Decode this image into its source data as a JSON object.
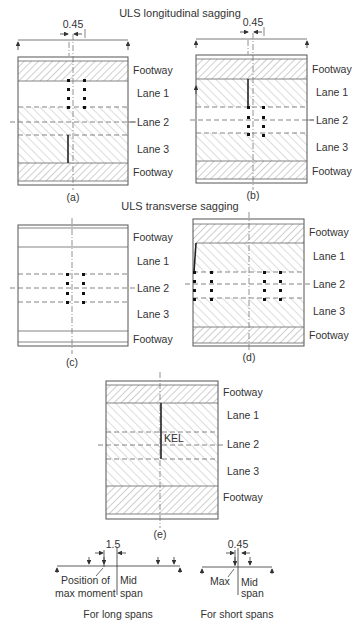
{
  "titles": {
    "longitudinal": "ULS longitudinal sagging",
    "transverse": "ULS transverse sagging"
  },
  "dimension_labels": {
    "a": "0.45",
    "b": "0.45"
  },
  "lanes": [
    "Footway",
    "Lane 1",
    "Lane 2",
    "Lane 3",
    "Footway"
  ],
  "panels": {
    "a": {
      "caption": "(a)"
    },
    "b": {
      "caption": "(b)"
    },
    "c": {
      "caption": "(c)"
    },
    "d": {
      "caption": "(d)"
    },
    "e": {
      "caption": "(e)",
      "kel_label": "KEL"
    }
  },
  "long_spans": {
    "dimension": "1.5",
    "label_position": "Position of",
    "label_max_moment": "max moment",
    "label_mid": "Mid",
    "label_span": "span",
    "caption": "For long spans"
  },
  "short_spans": {
    "dimension": "0.45",
    "label_max": "Max",
    "label_mid": "Mid",
    "label_span": "span",
    "caption": "For short spans"
  }
}
